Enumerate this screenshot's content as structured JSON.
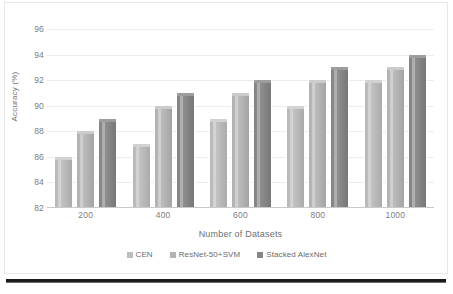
{
  "chart_data": {
    "type": "bar",
    "title": "",
    "xlabel": "Number of Datasets",
    "ylabel": "Accuracy (%)",
    "categories": [
      "200",
      "400",
      "600",
      "800",
      "1000"
    ],
    "series": [
      {
        "name": "CEN",
        "values": [
          86,
          87,
          89,
          90,
          92
        ],
        "color": "#bdbdbd"
      },
      {
        "name": "ResNet-50+SVM",
        "values": [
          88,
          90,
          91,
          92,
          93
        ],
        "color": "#b3b3b3"
      },
      {
        "name": "Stacked AlexNet",
        "values": [
          89,
          91,
          92,
          93,
          94
        ],
        "color": "#868686"
      }
    ],
    "ylim": [
      82,
      96
    ],
    "ytick_values": [
      82,
      84,
      86,
      88,
      90,
      92,
      94,
      96
    ],
    "ytick_labels": [
      "82",
      "84",
      "86",
      "88",
      "90",
      "92",
      "94",
      "96"
    ],
    "grid": true,
    "legend_position": "bottom",
    "legend": [
      "CEN",
      "ResNet-50+SVM",
      "Stacked AlexNet"
    ]
  }
}
